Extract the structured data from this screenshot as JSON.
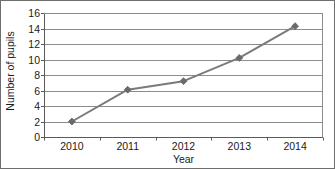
{
  "chart_data": {
    "type": "line",
    "title": "",
    "xlabel": "Year",
    "ylabel": "Number of pupils",
    "categories": [
      "2010",
      "2011",
      "2012",
      "2013",
      "2014"
    ],
    "values": [
      2,
      6.1,
      7.2,
      10.2,
      14.3
    ],
    "series": [
      {
        "name": "Number of pupils",
        "values": [
          2,
          6.1,
          7.2,
          10.2,
          14.3
        ]
      }
    ],
    "ylim": [
      0,
      16
    ],
    "ytick_labels": [
      "0",
      "2",
      "4",
      "6",
      "8",
      "10",
      "12",
      "14",
      "16"
    ],
    "ytick_values": [
      0,
      2,
      4,
      6,
      8,
      10,
      12,
      14,
      16
    ],
    "grid": "horizontal",
    "legend": "none",
    "marker": "diamond",
    "colors": {
      "line": "#7a7a7a",
      "marker": "#6b6b6b",
      "grid": "#8c8c8c",
      "axis": "#5a5a5a",
      "text": "#1a1a1a",
      "frame": "#6e6e6e",
      "background": "#ffffff"
    }
  }
}
